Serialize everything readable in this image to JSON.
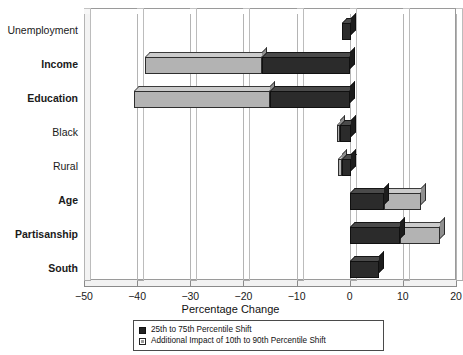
{
  "chart_data": {
    "type": "bar",
    "orientation": "horizontal",
    "stacked": true,
    "title": "",
    "xlabel": "Percentage Change",
    "ylabel": "",
    "xlim": [
      -50,
      20
    ],
    "xticks": [
      -50,
      -40,
      -30,
      -20,
      -10,
      0,
      10,
      20
    ],
    "xtick_labels": [
      "−50",
      "−40",
      "−30",
      "−20",
      "−10",
      "0",
      "10",
      "20"
    ],
    "grid": true,
    "grid_axis": "x",
    "legend_position": "bottom",
    "categories": [
      "Unemployment",
      "Income",
      "Education",
      "Black",
      "Rural",
      "Age",
      "Partisanship",
      "South"
    ],
    "category_emphasis": [
      false,
      true,
      true,
      false,
      false,
      true,
      true,
      true
    ],
    "series": [
      {
        "name": "25th to 75th Percentile Shift",
        "color": "#2b2b2b",
        "values": [
          -1.5,
          -16.5,
          -15.0,
          -1.8,
          -1.5,
          6.5,
          9.5,
          5.5
        ]
      },
      {
        "name": "Additional Impact of 10th to 90th Percentile Shift",
        "color": "#b3b3b3",
        "values": [
          0.0,
          -22.0,
          -25.5,
          -0.6,
          -0.7,
          7.0,
          7.5,
          0.0
        ]
      }
    ],
    "segment_ranges": [
      {
        "category": "Unemployment",
        "dark": [
          -1.5,
          0.2
        ],
        "light": null
      },
      {
        "category": "Income",
        "dark": [
          -16.5,
          0
        ],
        "light": [
          -38.5,
          -16.5
        ]
      },
      {
        "category": "Education",
        "dark": [
          -15.0,
          0
        ],
        "light": [
          -40.5,
          -15.0
        ]
      },
      {
        "category": "Black",
        "dark": [
          -1.8,
          0.2
        ],
        "light": [
          -2.4,
          -1.8
        ]
      },
      {
        "category": "Rural",
        "dark": [
          -1.5,
          0.3
        ],
        "light": [
          -2.2,
          -1.5
        ]
      },
      {
        "category": "Age",
        "dark": [
          0,
          6.5
        ],
        "light": [
          6.5,
          13.5
        ]
      },
      {
        "category": "Partisanship",
        "dark": [
          0,
          9.5
        ],
        "light": [
          9.5,
          17.0
        ]
      },
      {
        "category": "South",
        "dark": [
          0,
          5.5
        ],
        "light": null
      }
    ]
  },
  "axis": {
    "x_title": "Percentage Change",
    "ticks": [
      "−50",
      "−40",
      "−30",
      "−20",
      "−10",
      "0",
      "10",
      "20"
    ]
  },
  "categories": [
    {
      "label": "Unemployment",
      "bold": false
    },
    {
      "label": "Income",
      "bold": true
    },
    {
      "label": "Education",
      "bold": true
    },
    {
      "label": "Black",
      "bold": false
    },
    {
      "label": "Rural",
      "bold": false
    },
    {
      "label": "Age",
      "bold": true
    },
    {
      "label": "Partisanship",
      "bold": true
    },
    {
      "label": "South",
      "bold": true
    }
  ],
  "legend": {
    "items": [
      {
        "label": "25th to 75th Percentile Shift",
        "swatch": "dark"
      },
      {
        "label": "Additional Impact of 10th to 90th Percentile Shift",
        "swatch": "light"
      }
    ]
  },
  "colors": {
    "dark_segment": "#2b2b2b",
    "light_segment": "#b3b3b3",
    "frame": "#9a9a9a",
    "gridline": "#bcbcbc"
  }
}
